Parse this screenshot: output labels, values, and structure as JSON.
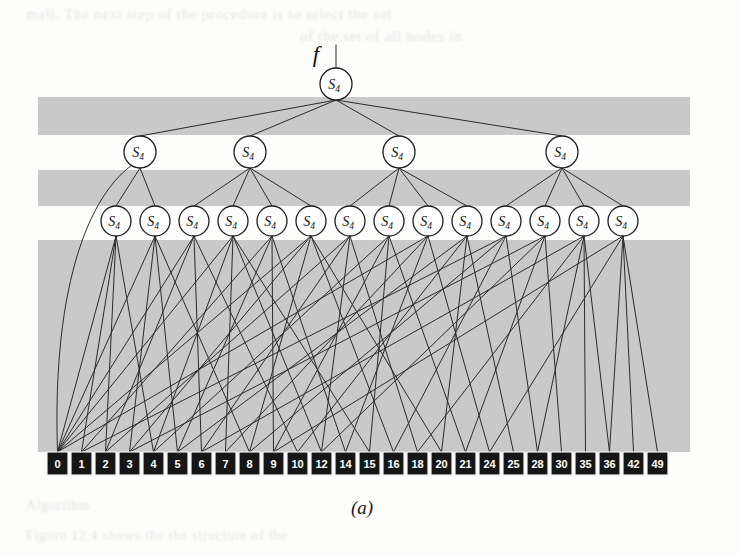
{
  "figure": {
    "caption": "(a)",
    "root_edge_label": "f",
    "node_label_base": "S",
    "node_label_subscript": "4",
    "colors": {
      "band": "#c9c9c9",
      "edge": "#2b2b2b",
      "node_fill": "#ffffff",
      "node_stroke": "#1d1d1d",
      "leaf_fill": "#161616",
      "leaf_text": "#ffffff",
      "page_background": "#fdfdfc"
    },
    "ghost_text": {
      "line1": "mall. The next step of the procedure is to select the set",
      "line2": "of the set of all nodes in",
      "line3": "Algorithm",
      "line4": "Figure 12.4 shows the the structure of the"
    },
    "levels": [
      {
        "name": "root",
        "depth": 0,
        "count": 1,
        "nodes": [
          {
            "label": "S",
            "sub": "4"
          }
        ]
      },
      {
        "name": "level-2",
        "depth": 1,
        "count": 4,
        "nodes": [
          {
            "label": "S",
            "sub": "4"
          },
          {
            "label": "S",
            "sub": "4"
          },
          {
            "label": "S",
            "sub": "4"
          },
          {
            "label": "S",
            "sub": "4"
          }
        ]
      },
      {
        "name": "level-3",
        "depth": 2,
        "count": 14,
        "nodes": [
          {
            "label": "S",
            "sub": "4"
          },
          {
            "label": "S",
            "sub": "4"
          },
          {
            "label": "S",
            "sub": "4"
          },
          {
            "label": "S",
            "sub": "4"
          },
          {
            "label": "S",
            "sub": "4"
          },
          {
            "label": "S",
            "sub": "4"
          },
          {
            "label": "S",
            "sub": "4"
          },
          {
            "label": "S",
            "sub": "4"
          },
          {
            "label": "S",
            "sub": "4"
          },
          {
            "label": "S",
            "sub": "4"
          },
          {
            "label": "S",
            "sub": "4"
          },
          {
            "label": "S",
            "sub": "4"
          },
          {
            "label": "S",
            "sub": "4"
          },
          {
            "label": "S",
            "sub": "4"
          }
        ]
      }
    ],
    "leaves": [
      "0",
      "1",
      "2",
      "3",
      "4",
      "5",
      "6",
      "7",
      "8",
      "9",
      "10",
      "12",
      "14",
      "15",
      "16",
      "18",
      "20",
      "21",
      "24",
      "25",
      "28",
      "30",
      "35",
      "36",
      "42",
      "49"
    ],
    "bands": [
      {
        "x": 38,
        "y": 97,
        "width": 652,
        "height": 38
      },
      {
        "x": 38,
        "y": 170,
        "width": 652,
        "height": 36
      },
      {
        "x": 38,
        "y": 240,
        "width": 652,
        "height": 212
      }
    ],
    "geometry": {
      "root": {
        "cx": 336,
        "cy": 84,
        "r": 16
      },
      "root_stem": {
        "x": 336,
        "y_top": 45,
        "y_bottom": 68
      },
      "f_label_pos": {
        "x": 316,
        "y": 62
      },
      "level2_y": 152,
      "level2_r": 16,
      "level2_x": [
        140,
        250,
        399,
        562
      ],
      "level3_y": 221,
      "level3_r": 15,
      "level3_x": [
        116,
        155,
        194,
        233,
        272,
        311,
        350,
        389,
        428,
        467,
        506,
        545,
        584,
        623
      ],
      "leaf_y": 452,
      "leaf_w": 21,
      "leaf_h": 23,
      "leaf_gap": 3,
      "leaf_x_start": 47,
      "caption_pos": {
        "x": 362,
        "y": 514
      }
    },
    "level2_to_level3_links": [
      [
        0,
        0
      ],
      [
        0,
        1
      ],
      [
        1,
        2
      ],
      [
        1,
        3
      ],
      [
        1,
        4
      ],
      [
        1,
        5
      ],
      [
        2,
        6
      ],
      [
        2,
        7
      ],
      [
        2,
        8
      ],
      [
        2,
        9
      ],
      [
        3,
        10
      ],
      [
        3,
        11
      ],
      [
        3,
        12
      ],
      [
        3,
        13
      ]
    ],
    "level2_direct_leaf_links": [
      {
        "from_level2": 0,
        "to_leaf": 0,
        "curved": true
      }
    ],
    "level3_to_leaf_links": [
      [
        0,
        0
      ],
      [
        0,
        1
      ],
      [
        0,
        2
      ],
      [
        0,
        4
      ],
      [
        1,
        0
      ],
      [
        1,
        3
      ],
      [
        1,
        5
      ],
      [
        1,
        8
      ],
      [
        2,
        0
      ],
      [
        2,
        2
      ],
      [
        2,
        6
      ],
      [
        2,
        10
      ],
      [
        3,
        0
      ],
      [
        3,
        4
      ],
      [
        3,
        7
      ],
      [
        3,
        11
      ],
      [
        3,
        13
      ],
      [
        4,
        1
      ],
      [
        4,
        5
      ],
      [
        4,
        9
      ],
      [
        4,
        12
      ],
      [
        5,
        0
      ],
      [
        5,
        3
      ],
      [
        5,
        8
      ],
      [
        5,
        14
      ],
      [
        5,
        16
      ],
      [
        6,
        2
      ],
      [
        6,
        6
      ],
      [
        6,
        11
      ],
      [
        6,
        15
      ],
      [
        7,
        4
      ],
      [
        7,
        9
      ],
      [
        7,
        13
      ],
      [
        7,
        17
      ],
      [
        8,
        0
      ],
      [
        8,
        7
      ],
      [
        8,
        12
      ],
      [
        8,
        18
      ],
      [
        9,
        5
      ],
      [
        9,
        10
      ],
      [
        9,
        16
      ],
      [
        9,
        19
      ],
      [
        10,
        1
      ],
      [
        10,
        8
      ],
      [
        10,
        14
      ],
      [
        10,
        20
      ],
      [
        11,
        3
      ],
      [
        11,
        11
      ],
      [
        11,
        17
      ],
      [
        11,
        21
      ],
      [
        12,
        6
      ],
      [
        12,
        15
      ],
      [
        12,
        20
      ],
      [
        12,
        22
      ],
      [
        12,
        23
      ],
      [
        13,
        9
      ],
      [
        13,
        18
      ],
      [
        13,
        23
      ],
      [
        13,
        24
      ],
      [
        13,
        25
      ]
    ]
  }
}
